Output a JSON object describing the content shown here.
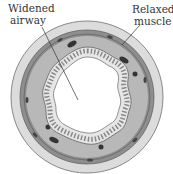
{
  "diagram": {
    "labels": {
      "widened_airway_line1": "Widened",
      "widened_airway_line2": "airway",
      "relaxed_muscle_line1": "Relaxed",
      "relaxed_muscle_line2": "muscle"
    },
    "colors": {
      "outer_ring": "#d9d9d9",
      "muscle_band": "#8a8a8a",
      "tissue": "#b5b5b5",
      "epithelium": "#e4e4e4",
      "lumen": "#ffffff",
      "dots": "#3a3a3a"
    }
  }
}
